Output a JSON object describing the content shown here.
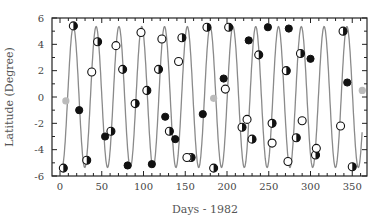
{
  "chart_data": {
    "type": "scatter",
    "title": "",
    "xlabel": "Days - 1982",
    "ylabel": "Latitude (Degree)",
    "xlim": [
      -10,
      368
    ],
    "ylim": [
      -6,
      6
    ],
    "xticks": [
      0,
      50,
      100,
      150,
      200,
      250,
      300,
      350
    ],
    "yticks": [
      -6,
      -4,
      -2,
      0,
      2,
      4,
      6
    ],
    "grid": false,
    "legend": null,
    "curve": {
      "name": "Fitted sinusoid",
      "type": "line",
      "color": "#8a8a8a",
      "amplitude": 5.35,
      "period_days": 27.3,
      "phase_peak_day": 16,
      "x_range": [
        3,
        362
      ]
    },
    "series": [
      {
        "name": "Half-filled markers",
        "marker": "half-filled-circle",
        "points": [
          [
            4,
            -5.4
          ],
          [
            16,
            5.4
          ],
          [
            32,
            -4.8
          ],
          [
            45,
            4.2
          ],
          [
            61,
            -2.6
          ],
          [
            75,
            2.1
          ],
          [
            90,
            -0.5
          ],
          [
            104,
            0.5
          ],
          [
            118,
            2.1
          ],
          [
            131,
            -2.6
          ],
          [
            146,
            4.5
          ],
          [
            157,
            -4.6
          ],
          [
            176,
            5.3
          ],
          [
            184,
            -5.4
          ],
          [
            202,
            5.3
          ],
          [
            218,
            -2.3
          ],
          [
            230,
            -3.2
          ],
          [
            238,
            3.2
          ],
          [
            254,
            -2.0
          ],
          [
            271,
            2.0
          ],
          [
            283,
            -3.1
          ],
          [
            288,
            3.3
          ],
          [
            306,
            -4.4
          ],
          [
            339,
            5.0
          ],
          [
            350,
            -5.3
          ]
        ]
      },
      {
        "name": "Filled markers",
        "marker": "filled-circle",
        "points": [
          [
            23,
            -1.0
          ],
          [
            54,
            -3.0
          ],
          [
            81,
            -5.2
          ],
          [
            110,
            -5.1
          ],
          [
            126,
            -1.5
          ],
          [
            138,
            -3.2
          ],
          [
            171,
            -1.3
          ],
          [
            196,
            1.4
          ],
          [
            226,
            4.3
          ],
          [
            249,
            5.3
          ],
          [
            274,
            5.2
          ],
          [
            300,
            2.9
          ],
          [
            344,
            1.1
          ]
        ]
      },
      {
        "name": "Open markers",
        "marker": "open-circle",
        "points": [
          [
            38,
            1.9
          ],
          [
            67,
            3.9
          ],
          [
            97,
            4.9
          ],
          [
            122,
            4.4
          ],
          [
            142,
            2.7
          ],
          [
            152,
            -4.6
          ],
          [
            198,
            0.6
          ],
          [
            224,
            -1.7
          ],
          [
            254,
            -3.5
          ],
          [
            273,
            -4.9
          ],
          [
            290,
            -1.8
          ],
          [
            307,
            -3.9
          ],
          [
            336,
            -2.2
          ]
        ]
      },
      {
        "name": "Gray markers",
        "marker": "gray-circle",
        "color": "#bbbbbb",
        "points": [
          [
            7,
            -0.3
          ],
          [
            184,
            -0.1
          ],
          [
            362,
            0.5
          ]
        ]
      }
    ]
  }
}
